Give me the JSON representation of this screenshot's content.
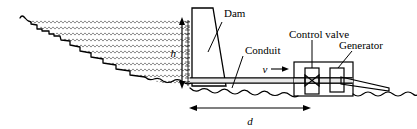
{
  "figure": {
    "kind": "engineering-schematic",
    "background_color": "#ffffff",
    "line_color": "#000000",
    "water_hatch_color": "#555555"
  },
  "labels": {
    "dam": "Dam",
    "conduit": "Conduit",
    "control_valve": "Control valve",
    "generator": "Generator"
  },
  "dimensions": {
    "height_symbol": "h",
    "distance_symbol": "d",
    "velocity_symbol": "v"
  },
  "parts": [
    {
      "name": "reservoir",
      "label": ""
    },
    {
      "name": "dam",
      "label": "Dam"
    },
    {
      "name": "conduit",
      "label": "Conduit"
    },
    {
      "name": "control-valve",
      "label": "Control valve"
    },
    {
      "name": "generator",
      "label": "Generator"
    },
    {
      "name": "powerhouse",
      "label": ""
    },
    {
      "name": "tailrace",
      "label": ""
    }
  ]
}
